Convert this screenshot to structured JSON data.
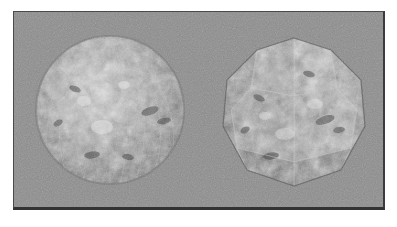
{
  "figure": {
    "kind": "3d-render-comparison",
    "background_color": "#8b8b8b",
    "page_color": "#ffffff",
    "border_color": "#3b3b3b",
    "objects": [
      {
        "id": "sphere",
        "name": "smooth-shaded-sphere",
        "shape": "sphere",
        "shading": "smooth",
        "texture": "bumpy-grayscale-noise",
        "mesh_lines_visible": true,
        "center_x": 96,
        "center_y": 97,
        "radius": 74,
        "base_color": "#8e8e8e",
        "highlight_color": "#d2d2d2",
        "shadow_color": "#4f4f4f"
      },
      {
        "id": "polyhedron",
        "name": "flat-shaded-polyhedron",
        "shape": "polyhedron",
        "shading": "flat",
        "texture": "bumpy-grayscale-noise",
        "facets": 14,
        "center_x": 286,
        "center_y": 103,
        "radius": 70,
        "base_color": "#8a8a8a",
        "highlight_color": "#c9c9c9",
        "shadow_color": "#4a4a4a"
      }
    ]
  },
  "render_canvas": {
    "label": "render-viewport",
    "width": 372,
    "height": 199
  }
}
